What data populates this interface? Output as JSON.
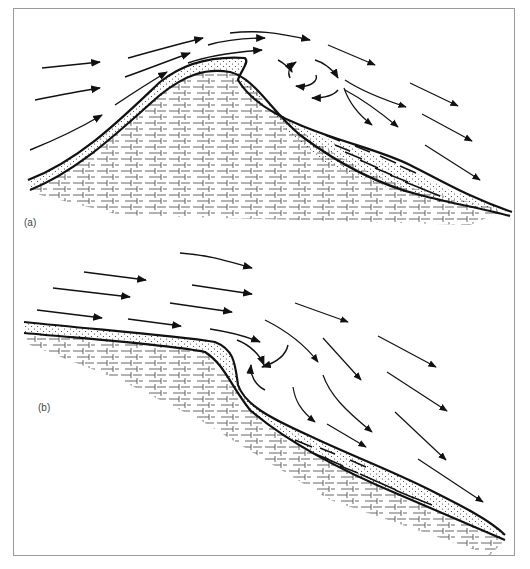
{
  "figure": {
    "panels": [
      {
        "id": "a",
        "label": "(a)",
        "description": "Flow over a symmetric ridge with lee-side eddy and sediment deposit on lee slope",
        "elements": [
          "incoming flow arrows",
          "dotted sediment layer",
          "brick-pattern bedrock",
          "lee eddy (circular arrows)",
          "lee deposit with cross-bedding",
          "downstream flow arrows"
        ]
      },
      {
        "id": "b",
        "label": "(b)",
        "description": "Flow over a slope break with lee-side eddy and sediment wedge on lower slope",
        "elements": [
          "incoming flow arrows",
          "dotted sediment layer",
          "brick-pattern bedrock",
          "lee eddy (curved arrows)",
          "lee deposit with cross-bedding",
          "downstream flow arrows"
        ]
      }
    ],
    "colors": {
      "line": "#111111",
      "rock": "#555555",
      "dots": "#333333",
      "frame": "#9a9a9a",
      "label": "#444444"
    }
  }
}
